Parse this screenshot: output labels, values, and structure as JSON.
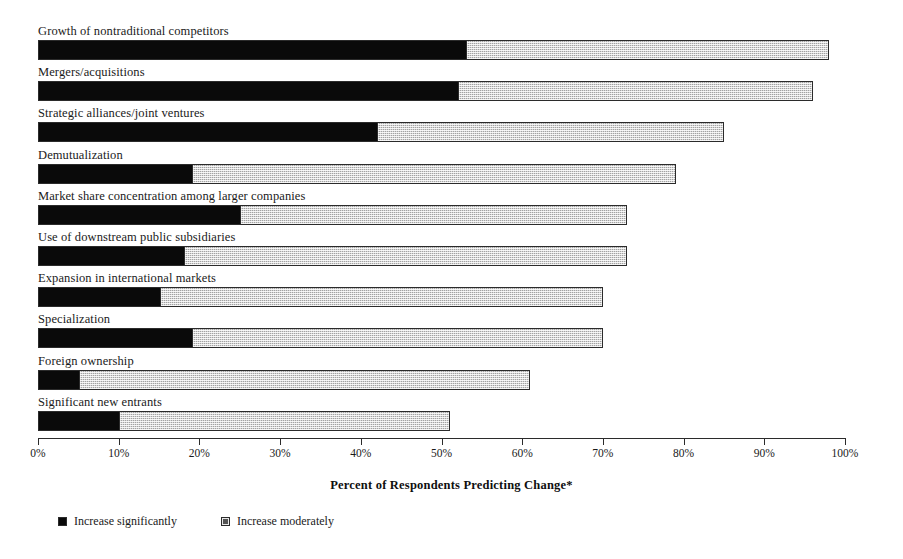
{
  "chart_data": {
    "type": "bar",
    "orientation": "horizontal",
    "stacked": true,
    "title": "",
    "xlabel": "Percent of Respondents Predicting Change*",
    "ylabel": "",
    "xlim": [
      0,
      100
    ],
    "xticks": [
      "0%",
      "10%",
      "20%",
      "30%",
      "40%",
      "50%",
      "60%",
      "70%",
      "80%",
      "90%",
      "100%"
    ],
    "grid": false,
    "legend_position": "bottom-left",
    "categories": [
      "Growth of nontraditional competitors",
      "Mergers/acquisitions",
      "Strategic alliances/joint ventures",
      "Demutualization",
      "Market share concentration among larger companies",
      "Use of downstream public subsidiaries",
      "Expansion in international markets",
      "Specialization",
      "Foreign ownership",
      "Significant new entrants"
    ],
    "series": [
      {
        "name": "Increase significantly",
        "color": "#0a0a0a",
        "values": [
          53,
          52,
          42,
          19,
          25,
          18,
          15,
          19,
          5,
          10
        ]
      },
      {
        "name": "Increase moderately",
        "color": "#d7d7d7",
        "values": [
          45,
          44,
          43,
          60,
          48,
          55,
          55,
          51,
          56,
          41
        ]
      }
    ],
    "totals": [
      98,
      96,
      85,
      79,
      73,
      73,
      70,
      70,
      61,
      51
    ]
  },
  "legend": {
    "items": [
      {
        "label": "Increase significantly",
        "swatch": "filled-black-square-icon"
      },
      {
        "label": "Increase moderately",
        "swatch": "stippled-light-square-icon"
      }
    ]
  },
  "axis": {
    "title": "Percent of Respondents Predicting Change*"
  }
}
